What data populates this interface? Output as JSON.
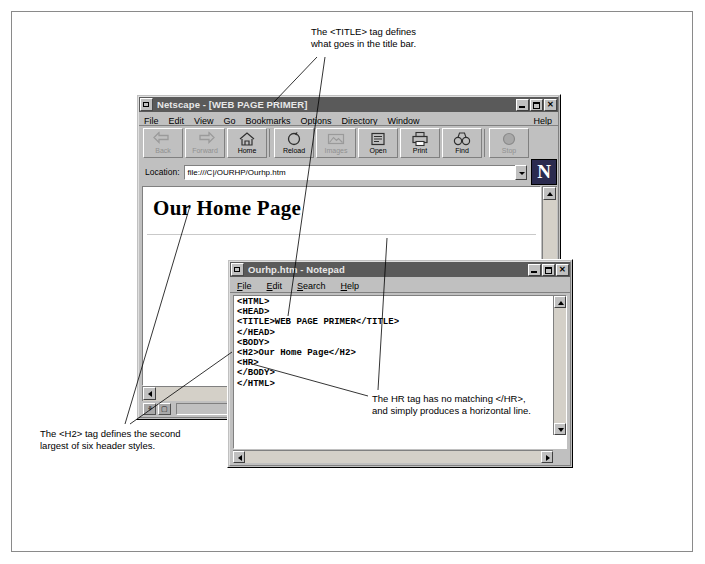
{
  "annotations": {
    "title_tag": "The <TITLE> tag defines\nwhat goes in the title bar.",
    "h2_tag": "The <H2> tag defines the second\nlargest of six header styles.",
    "hr_tag": "The HR tag has no matching </HR>,\nand simply produces a horizontal line."
  },
  "netscape": {
    "title": "Netscape - [WEB PAGE PRIMER]",
    "menus": [
      {
        "label": "File",
        "accel": "F"
      },
      {
        "label": "Edit",
        "accel": "E"
      },
      {
        "label": "View",
        "accel": "V"
      },
      {
        "label": "Go",
        "accel": "G"
      },
      {
        "label": "Bookmarks",
        "accel": "B"
      },
      {
        "label": "Options",
        "accel": "O"
      },
      {
        "label": "Directory",
        "accel": "D"
      },
      {
        "label": "Window",
        "accel": "W"
      }
    ],
    "help_menu": "Help",
    "toolbar": [
      {
        "label": "Back",
        "icon": "back-arrow-icon",
        "enabled": false
      },
      {
        "label": "Forward",
        "icon": "forward-arrow-icon",
        "enabled": false
      },
      {
        "label": "Home",
        "icon": "house-icon",
        "enabled": true
      },
      {
        "label": "Reload",
        "icon": "reload-icon",
        "enabled": true
      },
      {
        "label": "Images",
        "icon": "images-icon",
        "enabled": false
      },
      {
        "label": "Open",
        "icon": "open-icon",
        "enabled": true
      },
      {
        "label": "Print",
        "icon": "printer-icon",
        "enabled": true
      },
      {
        "label": "Find",
        "icon": "binoculars-icon",
        "enabled": true
      },
      {
        "label": "Stop",
        "icon": "stop-sign-icon",
        "enabled": false
      }
    ],
    "location_label": "Location:",
    "location_value": "file:///C|/OURHP/Ourhp.htm",
    "logo_letter": "N",
    "page_heading": "Our Home Page",
    "window_buttons": {
      "minimize": "_",
      "maximize": "□",
      "close": "✕"
    },
    "status_icons": [
      "security-key-icon",
      "page-status-icon"
    ]
  },
  "notepad": {
    "title": "Ourhp.htm - Notepad",
    "menus": [
      {
        "label": "File",
        "accel": "F"
      },
      {
        "label": "Edit",
        "accel": "E"
      },
      {
        "label": "Search",
        "accel": "S"
      },
      {
        "label": "Help",
        "accel": "H"
      }
    ],
    "source": "<HTML>\n<HEAD>\n<TITLE>WEB PAGE PRIMER</TITLE>\n</HEAD>\n<BODY>\n<H2>Our Home Page</H2>\n<HR>\n</BODY>\n</HTML>",
    "window_buttons": {
      "minimize": "_",
      "maximize": "□",
      "close": "✕"
    }
  },
  "colors": {
    "chrome": "#c0c0c0",
    "titlebar_active": "#5a5a5a",
    "page_bg": "#ffffff",
    "frame_border": "#8a8a8a"
  }
}
